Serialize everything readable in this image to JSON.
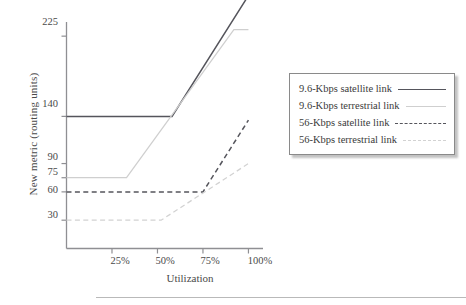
{
  "chart_data": {
    "type": "line",
    "title": "",
    "xlabel": "Utilization",
    "ylabel": "New metric (routing units)",
    "xlim": [
      0,
      108
    ],
    "ylim": [
      0,
      240
    ],
    "grid": false,
    "legend_position": "right",
    "x_tick_labels": [
      "25%",
      "50%",
      "75%",
      "100%"
    ],
    "x_tick_values": [
      25,
      50,
      75,
      100
    ],
    "y_tick_labels": [
      "225",
      "140",
      "90",
      "75",
      "60",
      "30"
    ],
    "y_tick_values": [
      225,
      140,
      90,
      75,
      60,
      30
    ],
    "series": [
      {
        "name": "9.6-Kbps satellite link",
        "style": "solid-dark",
        "color": "#55555c",
        "x": [
          0,
          58,
          100
        ],
        "y": [
          140,
          140,
          268
        ]
      },
      {
        "name": "9.6-Kbps terrestrial link",
        "style": "solid-light",
        "color": "#cfcfcf",
        "x": [
          0,
          33,
          92,
          100
        ],
        "y": [
          75,
          75,
          232,
          232
        ]
      },
      {
        "name": "56-Kbps satellite link",
        "style": "dash-dark",
        "color": "#55555c",
        "x": [
          0,
          75,
          100
        ],
        "y": [
          60,
          60,
          136
        ]
      },
      {
        "name": "56-Kbps terrestrial link",
        "style": "dash-light",
        "color": "#d2d2d2",
        "x": [
          0,
          52,
          100
        ],
        "y": [
          30,
          30,
          90
        ]
      }
    ]
  },
  "legend": {
    "items": [
      {
        "label": "9.6-Kbps satellite link",
        "style": "solid-dark"
      },
      {
        "label": "9.6-Kbps terrestrial link",
        "style": "solid-light"
      },
      {
        "label": "56-Kbps satellite link",
        "style": "dash-dark"
      },
      {
        "label": "56-Kbps terrestrial link",
        "style": "dash-light"
      }
    ]
  },
  "colors": {
    "axis": "#8f8f93",
    "dark_line": "#55555c",
    "light_line": "#cfcfcf",
    "text": "#3a3a3a",
    "legend_border": "#8a8a8a"
  }
}
